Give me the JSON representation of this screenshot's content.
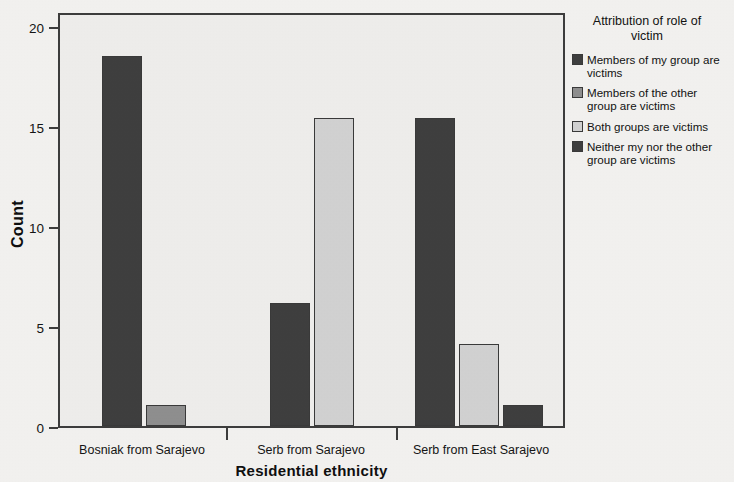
{
  "chart_data": {
    "type": "bar",
    "title": "",
    "xlabel": "Residential ethnicity",
    "ylabel": "Count",
    "categories": [
      "Bosniak from Sarajevo",
      "Serb from Sarajevo",
      "Serb from East Sarajevo"
    ],
    "ylim": [
      0,
      20
    ],
    "yticks": [
      0,
      5,
      10,
      15,
      20
    ],
    "ytick_labels": [
      "0",
      "5",
      "10",
      "15",
      "20"
    ],
    "grid": false,
    "legend_position": "right",
    "legend_title": "Attribution of role of victim",
    "series": [
      {
        "name": "Members of my group are victims",
        "color": "#3f3f3f",
        "values": [
          18,
          6,
          15
        ]
      },
      {
        "name": "Members of the other group are victims",
        "color": "#8f8f8f",
        "values": [
          1,
          0,
          0
        ]
      },
      {
        "name": "Both groups are victims",
        "color": "#d2d2d2",
        "values": [
          0,
          15,
          4
        ]
      },
      {
        "name": "Neither my nor the other group are victims",
        "color": "#3f3f3f",
        "values": [
          0,
          0,
          1
        ]
      }
    ]
  },
  "axes": {
    "y_title": "Count",
    "x_title": "Residential ethnicity",
    "y_tick_0": "0",
    "y_tick_1": "5",
    "y_tick_2": "10",
    "y_tick_3": "15",
    "y_tick_4": "20",
    "x_cat_0": "Bosniak from Sarajevo",
    "x_cat_1": "Serb from Sarajevo",
    "x_cat_2": "Serb from East Sarajevo"
  },
  "legend": {
    "title_line_1": "Attribution of role of",
    "title_line_2": "victim",
    "title": "Attribution of role of victim",
    "items": [
      {
        "label": "Members of my group are victims",
        "color": "#3f3f3f"
      },
      {
        "label": "Members of the other group are victims",
        "color": "#8f8f8f"
      },
      {
        "label": "Both groups are victims",
        "color": "#d2d2d2"
      },
      {
        "label": "Neither my nor the other group are victims",
        "color": "#3f3f3f"
      }
    ]
  }
}
